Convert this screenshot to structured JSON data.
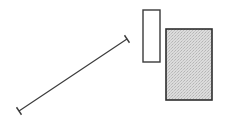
{
  "diagram": {
    "background": "#ffffff",
    "stroke_color": "#3a3a3a",
    "segment": {
      "shape": "line-segment-with-end-ticks",
      "x1": 19,
      "y1": 111,
      "x2": 127,
      "y2": 39,
      "tick_length": 9
    },
    "outline_rect": {
      "shape": "rectangle",
      "fill": "#ffffff",
      "x": 143,
      "y": 10,
      "width": 17,
      "height": 52
    },
    "filled_rect": {
      "shape": "rectangle",
      "fill": "#d8d8d8",
      "pattern": "stipple",
      "x": 166,
      "y": 29,
      "width": 46,
      "height": 71
    }
  }
}
